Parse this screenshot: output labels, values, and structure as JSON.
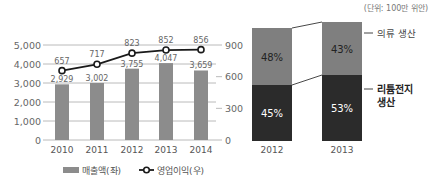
{
  "chart_data": [
    {
      "type": "bar+line",
      "title": "",
      "categories": [
        "2010",
        "2011",
        "2012",
        "2013",
        "2014"
      ],
      "series": [
        {
          "name": "매출액(좌)",
          "type": "bar",
          "axis": "left",
          "values": [
            2929,
            3002,
            3755,
            4047,
            3659
          ],
          "labels": [
            "2,929",
            "3,002",
            "3,755",
            "4,047",
            "3,659"
          ],
          "color": "#8c8c8c"
        },
        {
          "name": "영업이익(우)",
          "type": "line",
          "axis": "right",
          "values": [
            657,
            717,
            823,
            852,
            856
          ],
          "labels": [
            "657",
            "717",
            "823",
            "852",
            "856"
          ],
          "color": "#1a1a1a"
        }
      ],
      "left_axis": {
        "ticks": [
          "0",
          "1,000",
          "2,000",
          "3,000",
          "4,000",
          "5,000"
        ],
        "ylim": [
          0,
          5000
        ]
      },
      "right_axis": {
        "ticks": [
          "0",
          "300",
          "600",
          "900"
        ],
        "ylim": [
          0,
          900
        ]
      },
      "grid": true,
      "legend_position": "bottom"
    },
    {
      "type": "stacked_bar",
      "unit_note": "(단위: 100만 위안)",
      "categories": [
        "2012",
        "2013"
      ],
      "series": [
        {
          "name": "리튬전지 생산",
          "values": [
            45,
            53
          ],
          "labels": [
            "45%",
            "53%"
          ],
          "color": "#2b2b2b"
        },
        {
          "name": "의류 생산",
          "values": [
            48,
            43
          ],
          "labels": [
            "48%",
            "43%"
          ],
          "color": "#7f7f7f"
        }
      ],
      "annotations": [
        "의류 생산",
        "리튬전지",
        "생산"
      ]
    }
  ]
}
